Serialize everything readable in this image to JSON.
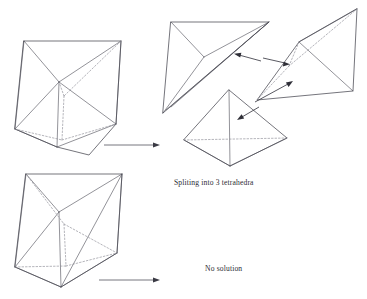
{
  "figure": {
    "type": "geometry-diagram",
    "background_color": "#ffffff",
    "line_color": "#3a3a44",
    "hidden_line_color": "#8d8d96",
    "hidden_line_style": "dashed"
  },
  "captions": {
    "split": "Spliting into 3 tetrahedra",
    "no_solution": "No solution"
  },
  "panels": [
    {
      "name": "prism-top-left",
      "label": "triangular prism with valid diagonal configuration",
      "outcome": "Spliting into 3 tetrahedra"
    },
    {
      "name": "tetrahedron-top-middle",
      "label": "first tetrahedron piece, exploded view"
    },
    {
      "name": "tetrahedron-top-right",
      "label": "second tetrahedron piece, exploded view"
    },
    {
      "name": "tetrahedron-bottom-middle",
      "label": "third tetrahedron piece, exploded view"
    },
    {
      "name": "prism-bottom-left",
      "label": "triangular prism with conflicting diagonal configuration",
      "outcome": "No solution"
    }
  ],
  "arrows": [
    {
      "name": "flow-arrow-split",
      "from": "prism-top-left",
      "to": "tetrahedra-group",
      "direction": "right"
    },
    {
      "name": "flow-arrow-no-solution",
      "from": "prism-bottom-left",
      "to": "no-solution-label",
      "direction": "right"
    },
    {
      "name": "pointer-to-top-middle",
      "direction": "left"
    },
    {
      "name": "pointer-to-top-right",
      "direction": "right"
    },
    {
      "name": "pointer-to-bottom-middle",
      "direction": "left"
    },
    {
      "name": "pointer-to-right-tetra",
      "direction": "up-right"
    }
  ]
}
